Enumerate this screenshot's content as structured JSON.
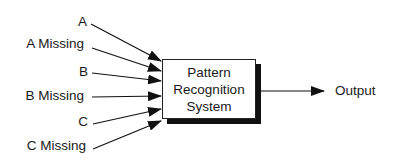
{
  "diagram": {
    "inputs": [
      {
        "label": "A"
      },
      {
        "label": "A Missing"
      },
      {
        "label": "B"
      },
      {
        "label": "B Missing"
      },
      {
        "label": "C"
      },
      {
        "label": "C Missing"
      }
    ],
    "system": {
      "lines": [
        "Pattern",
        "Recognition",
        "System"
      ]
    },
    "output": {
      "label": "Output"
    }
  }
}
